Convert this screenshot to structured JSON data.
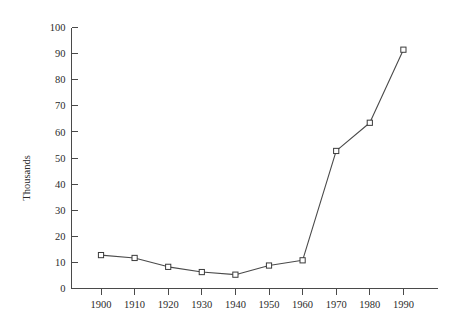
{
  "chart_data": {
    "type": "line",
    "title": "",
    "subtitle": "",
    "xlabel": "",
    "ylabel": "Thousands",
    "categories": [
      "1900",
      "1910",
      "1920",
      "1930",
      "1940",
      "1950",
      "1960",
      "1970",
      "1980",
      "1990"
    ],
    "x": [
      1900,
      1910,
      1920,
      1930,
      1940,
      1950,
      1960,
      1970,
      1980,
      1990
    ],
    "values": [
      12.8,
      11.7,
      8.3,
      6.3,
      5.3,
      8.8,
      10.8,
      52.7,
      63.5,
      91.5
    ],
    "series": [
      {
        "name": "Thousands",
        "values": [
          12.8,
          11.7,
          8.3,
          6.3,
          5.3,
          8.8,
          10.8,
          52.7,
          63.5,
          91.5
        ]
      }
    ],
    "ylim": [
      0,
      100
    ],
    "xlim": [
      1895,
      1995
    ],
    "y_ticks": [
      0,
      10,
      20,
      30,
      40,
      50,
      60,
      70,
      80,
      90,
      100
    ],
    "y_tick_labels": [
      "0",
      "10",
      "20",
      "30",
      "40",
      "50",
      "60",
      "70",
      "80",
      "90",
      "100"
    ],
    "x_ticks": [
      1900,
      1910,
      1920,
      1930,
      1940,
      1950,
      1960,
      1970,
      1980,
      1990
    ],
    "x_tick_labels": [
      "1900",
      "1910",
      "1920",
      "1930",
      "1940",
      "1950",
      "1960",
      "1970",
      "1980",
      "1990"
    ],
    "grid": false,
    "legend": false,
    "legend_position": "none",
    "marker": "open-square",
    "annotations": [],
    "colors": {
      "background": "#ffffff",
      "line": "#4a4a4a",
      "marker_fill": "#ffffff",
      "marker_stroke": "#3a3a3a",
      "axis": "#4a4a4a",
      "text": "#2b2b2b"
    }
  }
}
